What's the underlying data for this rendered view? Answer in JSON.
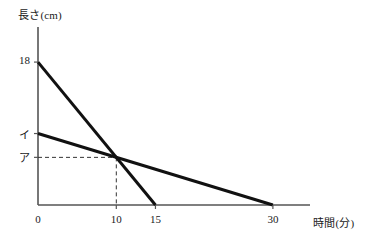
{
  "chart_data": {
    "type": "line",
    "title": "",
    "xlabel": "時間(分)",
    "ylabel": "長さ(cm)",
    "xlim": [
      0,
      36
    ],
    "ylim": [
      0,
      20
    ],
    "grid": false,
    "legend": "none",
    "x_ticks": [
      {
        "value": 0,
        "label": "0"
      },
      {
        "value": 10,
        "label": "10"
      },
      {
        "value": 15,
        "label": "15"
      },
      {
        "value": 30,
        "label": "30"
      }
    ],
    "y_ticks": [
      {
        "value": 18,
        "label": "18"
      },
      {
        "value": 9,
        "label": "イ"
      },
      {
        "value": 6,
        "label": "ア"
      }
    ],
    "series": [
      {
        "name": "steep-candle",
        "points": [
          [
            0,
            18
          ],
          [
            15,
            0
          ]
        ],
        "style": "solid-thick"
      },
      {
        "name": "shallow-candle",
        "points": [
          [
            0,
            9
          ],
          [
            30,
            0
          ]
        ],
        "style": "solid-thick"
      }
    ],
    "annotations": [
      {
        "name": "intersection-guides",
        "style": "dashed",
        "point": [
          10,
          6
        ],
        "horizontal_to_axis": true,
        "vertical_to_axis": true
      }
    ],
    "colors": {
      "line": "#111111",
      "axis": "#555555",
      "dashed": "#333333",
      "background": "#ffffff"
    }
  }
}
